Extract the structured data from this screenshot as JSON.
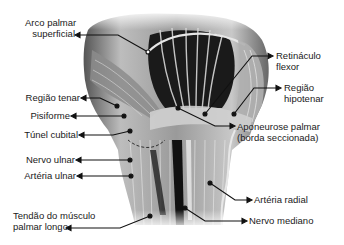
{
  "figure": {
    "labels_left": [
      {
        "id": "arco-palmar",
        "line1": "Arco palmar",
        "line2": "superficial"
      },
      {
        "id": "regiao-tenar",
        "line1": "Região tenar"
      },
      {
        "id": "pisiforme",
        "line1": "Pisiforme"
      },
      {
        "id": "tunel-cubital",
        "line1": "Túnel cubital"
      },
      {
        "id": "nervo-ulnar",
        "line1": "Nervo ulnar"
      },
      {
        "id": "arteria-ulnar",
        "line1": "Artéria ulnar"
      },
      {
        "id": "tendao-palmar-longo",
        "line1": "Tendão do músculo",
        "line2": "palmar longo"
      }
    ],
    "labels_right": [
      {
        "id": "retinaculo-flexor",
        "line1": "Retináculo",
        "line2": "flexor"
      },
      {
        "id": "regiao-hipotenar",
        "line1": "Região",
        "line2": "hipotenar"
      },
      {
        "id": "aponeurose-palmar",
        "line1": "Aponeurose palmar",
        "line2": "(borda seccionada)"
      },
      {
        "id": "arteria-radial",
        "line1": "Artéria radial"
      },
      {
        "id": "nervo-mediano",
        "line1": "Nervo mediano"
      }
    ]
  }
}
